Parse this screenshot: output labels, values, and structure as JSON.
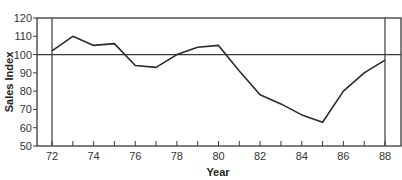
{
  "chart_data": {
    "type": "line",
    "title": "",
    "xlabel": "Year",
    "ylabel": "Sales Index",
    "ylim": [
      50,
      120
    ],
    "xlim": [
      72,
      88
    ],
    "grid": false,
    "reference_line": {
      "y": 100
    },
    "vertical_markers": [
      72,
      88
    ],
    "y_ticks": [
      50,
      60,
      70,
      80,
      90,
      100,
      110,
      120
    ],
    "x_tick_labels": [
      "72",
      "74",
      "76",
      "78",
      "80",
      "82",
      "84",
      "86",
      "88"
    ],
    "x": [
      72,
      73,
      74,
      75,
      76,
      77,
      78,
      79,
      80,
      81,
      82,
      83,
      84,
      85,
      86,
      87,
      88
    ],
    "series": [
      {
        "name": "Sales Index",
        "values": [
          102,
          110,
          105,
          106,
          94,
          93,
          100,
          104,
          105,
          91,
          78,
          73,
          67,
          63,
          80,
          90,
          97
        ]
      }
    ]
  }
}
